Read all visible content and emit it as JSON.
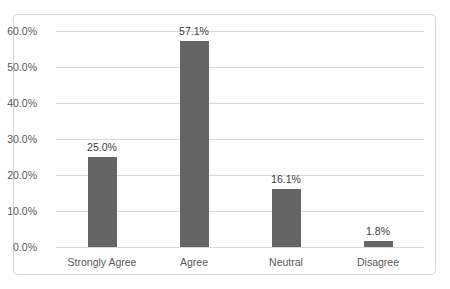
{
  "chart_data": {
    "type": "bar",
    "title": "",
    "xlabel": "",
    "ylabel": "",
    "categories": [
      "Strongly Agree",
      "Agree",
      "Neutral",
      "Disagree"
    ],
    "values": [
      25.0,
      57.1,
      16.1,
      1.8
    ],
    "value_labels": [
      "25.0%",
      "57.1%",
      "16.1%",
      "1.8%"
    ],
    "ylim": [
      0,
      60
    ],
    "ytick_values": [
      0,
      10,
      20,
      30,
      40,
      50,
      60
    ],
    "ytick_labels": [
      "0.0%",
      "10.0%",
      "20.0%",
      "30.0%",
      "40.0%",
      "50.0%",
      "60.0%"
    ],
    "grid": true,
    "legend_position": "none",
    "colors": {
      "bar_fill": "#656565",
      "gridline": "#d9d9d9",
      "tick_text": "#595959",
      "category_text": "#595959",
      "value_label_text": "#404040",
      "chart_border": "#d6d6d6",
      "background": "#ffffff"
    }
  }
}
